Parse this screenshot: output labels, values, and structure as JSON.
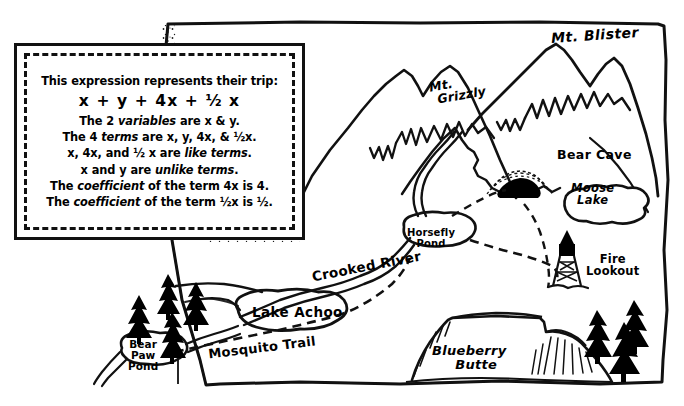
{
  "lesson_box": {
    "name": "expression-explanation-box",
    "lines": [
      {
        "text": "This expression represents their trip:",
        "style": "plain"
      },
      {
        "text": "x + y + 4x + ½ x",
        "style": "expression"
      },
      {
        "text": "The 2 variables are x & y.",
        "style": "plain"
      },
      {
        "text": "The 4 terms are x, y, 4x, & ½x.",
        "style": "plain"
      },
      {
        "text": "x, 4x, and ½ x are like terms.",
        "style": "plain"
      },
      {
        "text": "x and y are unlike terms.",
        "style": "plain"
      },
      {
        "text": "The coefficient of the term 4x is 4.",
        "style": "plain"
      },
      {
        "text": "The coefficient of the term ½x is ½.",
        "style": "plain"
      }
    ],
    "expression": "x + y + 4x + ½ x",
    "variable_count": "2",
    "variables": "x & y",
    "term_count": "4",
    "terms": "x, y, 4x, & ½x",
    "like_terms": "x, 4x, and ½ x",
    "unlike_terms": "x and y",
    "coefficients": [
      {
        "term": "4x",
        "value": "4"
      },
      {
        "term": "½x",
        "value": "½"
      }
    ]
  },
  "map": {
    "labels": [
      {
        "id": "mt-blister",
        "text": "Mt. Blister",
        "kind": "mountain"
      },
      {
        "id": "mt-grizzly",
        "text": "Mt. Grizzly",
        "kind": "mountain"
      },
      {
        "id": "bear-cave",
        "text": "Bear Cave",
        "kind": "cave"
      },
      {
        "id": "moose-lake",
        "text": "Moose\nLake",
        "kind": "lake"
      },
      {
        "id": "fire-lookout",
        "text": "Fire\nLookout",
        "kind": "tower"
      },
      {
        "id": "horsefly-pond",
        "text": "Horsefly\nPond",
        "kind": "pond"
      },
      {
        "id": "crooked-river",
        "text": "Crooked River",
        "kind": "river"
      },
      {
        "id": "lake-achoo",
        "text": "Lake Achoo",
        "kind": "lake"
      },
      {
        "id": "bear-paw-pond",
        "text": "Bear\nPaw\nPond",
        "kind": "pond"
      },
      {
        "id": "mosquito-trail",
        "text": "Mosquito Trail",
        "kind": "trail"
      },
      {
        "id": "blueberry-butte",
        "text": "Blueberry\nButte",
        "kind": "butte"
      }
    ],
    "label_text": {
      "mt_blister": "Mt. Blister",
      "mt_grizzly_line1": "Mt.",
      "mt_grizzly_line2": "Grizzly",
      "bear_cave": "Bear Cave",
      "moose_line1": "Moose",
      "moose_line2": "Lake",
      "fire_line1": "Fire",
      "fire_line2": "Lookout",
      "horsefly_line1": "Horsefly",
      "horsefly_line2": "Pond",
      "crooked_river": "Crooked River",
      "lake_achoo": "Lake Achoo",
      "bearpaw_line1": "Bear",
      "bearpaw_line2": "Paw",
      "bearpaw_line3": "Pond",
      "mosquito_trail": "Mosquito Trail",
      "blueberry_line1": "Blueberry",
      "blueberry_line2": "Butte"
    },
    "colors": {
      "ink": "#111111",
      "paper": "#ffffff",
      "fill_dark": "#000000"
    },
    "features": {
      "trees_left_count": 4,
      "trees_right_count": 3,
      "trail_style": "dashed",
      "river_style": "solid-double"
    }
  }
}
